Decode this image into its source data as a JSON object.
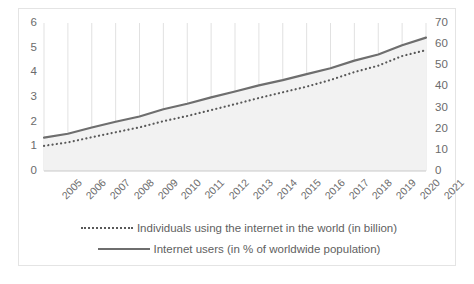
{
  "chart_data": {
    "type": "line",
    "title": "",
    "xlabel": "",
    "ylabel": "",
    "grid": "vertical",
    "legend_position": "bottom",
    "categories": [
      "2005",
      "2006",
      "2007",
      "2008",
      "2009",
      "2010",
      "2011",
      "2012",
      "2013",
      "2014",
      "2015",
      "2016",
      "2017",
      "2018",
      "2019",
      "2020",
      "2021"
    ],
    "axes": {
      "left": {
        "label": "in billion",
        "min": 0,
        "max": 6,
        "ticks": [
          0,
          1,
          2,
          3,
          4,
          5,
          6
        ]
      },
      "right": {
        "label": "in % of worldwide population",
        "min": 0,
        "max": 70,
        "ticks": [
          0,
          10,
          20,
          30,
          40,
          50,
          60,
          70
        ]
      }
    },
    "series": [
      {
        "name": "Individuals using the internet in the world (in billion)",
        "axis": "left",
        "style": "dotted",
        "color": "#595959",
        "values": [
          1.02,
          1.16,
          1.37,
          1.57,
          1.77,
          2.02,
          2.23,
          2.47,
          2.71,
          2.96,
          3.19,
          3.42,
          3.69,
          4.01,
          4.27,
          4.66,
          4.9
        ]
      },
      {
        "name": "Internet users (in % of worldwide population)",
        "axis": "right",
        "style": "solid",
        "color": "#6e6e6e",
        "values": [
          15.8,
          17.6,
          20.6,
          23.3,
          25.8,
          29.2,
          31.8,
          34.8,
          37.6,
          40.5,
          43.0,
          45.8,
          48.6,
          52.2,
          55.1,
          59.5,
          63.1
        ]
      }
    ]
  },
  "legend": {
    "entries": [
      {
        "label": "Individuals using the internet in the world (in billion)",
        "key": "dotted-line-key"
      },
      {
        "label": "Internet users (in % of worldwide population)",
        "key": "solid-line-key"
      }
    ]
  }
}
